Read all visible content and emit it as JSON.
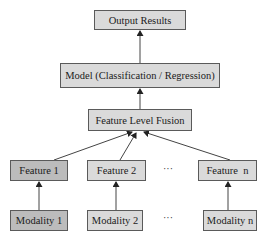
{
  "diagram": {
    "nodes": {
      "output": {
        "label": "Output Results"
      },
      "model": {
        "label": "Model (Classification / Regression)"
      },
      "fusion": {
        "label": "Feature Level Fusion"
      },
      "features": [
        {
          "label": "Feature 1"
        },
        {
          "label": "Feature 2"
        },
        {
          "label": "Feature  n"
        }
      ],
      "modalities": [
        {
          "label": "Modality 1"
        },
        {
          "label": "Modality 2"
        },
        {
          "label": "Modality n"
        }
      ]
    },
    "ellipsis": "···",
    "edges": [
      {
        "from": "Modality 1",
        "to": "Feature 1"
      },
      {
        "from": "Modality 2",
        "to": "Feature 2"
      },
      {
        "from": "Modality n",
        "to": "Feature  n"
      },
      {
        "from": "Feature 1",
        "to": "Feature Level Fusion"
      },
      {
        "from": "Feature 2",
        "to": "Feature Level Fusion"
      },
      {
        "from": "Feature  n",
        "to": "Feature Level Fusion"
      },
      {
        "from": "Feature Level Fusion",
        "to": "Model (Classification / Regression)"
      },
      {
        "from": "Model (Classification / Regression)",
        "to": "Output Results"
      }
    ],
    "colors": {
      "box_fill": "#dadada",
      "box_fill_highlight": "#bcbcbc",
      "border": "#5a5a5a",
      "arrow": "#333333"
    }
  }
}
